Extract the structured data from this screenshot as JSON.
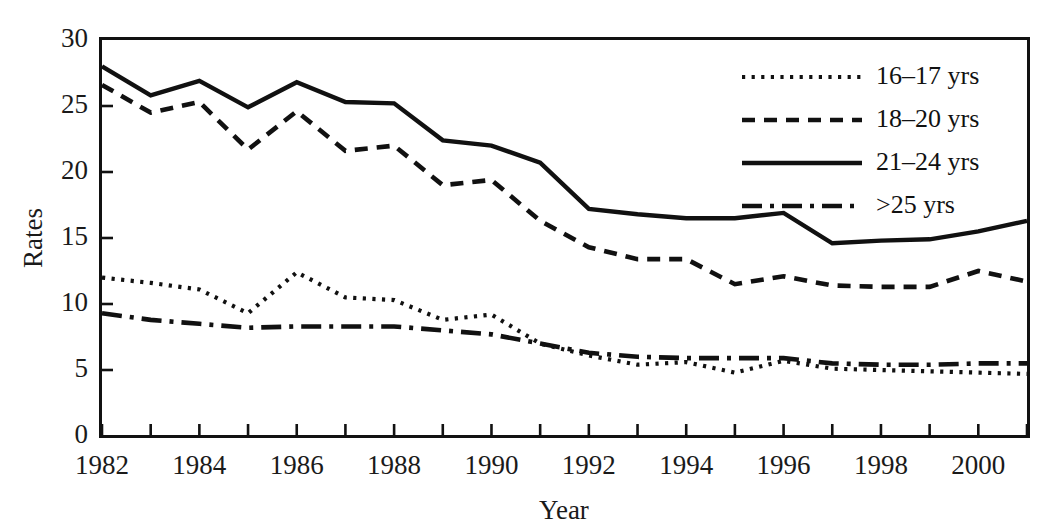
{
  "chart_data": {
    "type": "line",
    "title": "",
    "xlabel": "Year",
    "ylabel": "Rates",
    "x": [
      1982,
      1983,
      1984,
      1985,
      1986,
      1987,
      1988,
      1989,
      1990,
      1991,
      1992,
      1993,
      1994,
      1995,
      1996,
      1997,
      1998,
      1999,
      2000,
      2001
    ],
    "xlim": [
      1982,
      2001
    ],
    "ylim": [
      0,
      30
    ],
    "y_ticks": [
      0,
      5,
      10,
      15,
      20,
      25,
      30
    ],
    "y_tick_labels": [
      "0",
      "5",
      "10",
      "15",
      "20",
      "25",
      "30"
    ],
    "x_tick_labels": [
      "1982",
      "",
      "1984",
      "",
      "1986",
      "",
      "1988",
      "",
      "1990",
      "",
      "1992",
      "",
      "1994",
      "",
      "1996",
      "",
      "1998",
      "",
      "2000",
      ""
    ],
    "x_labeled_years": [
      "1982",
      "1984",
      "1986",
      "1988",
      "1990",
      "1992",
      "1994",
      "1996",
      "1998",
      "2000"
    ],
    "grid": false,
    "legend_position": "top-right",
    "series": [
      {
        "name": "16–17 yrs",
        "style": "dotted",
        "values": [
          12.0,
          11.6,
          11.1,
          9.3,
          12.4,
          10.5,
          10.3,
          8.8,
          9.2,
          7.0,
          6.1,
          5.4,
          5.6,
          4.8,
          5.7,
          5.1,
          5.0,
          4.9,
          4.8,
          4.7
        ]
      },
      {
        "name": "18–20 yrs",
        "style": "dashed",
        "values": [
          26.6,
          24.5,
          25.3,
          21.7,
          24.6,
          21.6,
          22.0,
          19.0,
          19.4,
          16.3,
          14.3,
          13.4,
          13.4,
          11.5,
          12.1,
          11.4,
          11.3,
          11.3,
          12.5,
          11.7
        ]
      },
      {
        "name": "21–24 yrs",
        "style": "solid",
        "values": [
          28.0,
          25.8,
          26.9,
          24.9,
          26.8,
          25.3,
          25.2,
          22.4,
          22.0,
          20.7,
          17.2,
          16.8,
          16.5,
          16.5,
          16.9,
          14.6,
          14.8,
          14.9,
          15.5,
          16.3
        ]
      },
      {
        "name": ">25 yrs",
        "style": "dashdot",
        "values": [
          9.3,
          8.8,
          8.5,
          8.2,
          8.3,
          8.3,
          8.3,
          8.0,
          7.7,
          7.0,
          6.3,
          6.0,
          5.9,
          5.9,
          5.9,
          5.5,
          5.4,
          5.4,
          5.5,
          5.5
        ]
      }
    ],
    "legend": [
      {
        "label": "16–17 yrs",
        "style": "dotted"
      },
      {
        "label": "18–20 yrs",
        "style": "dashed"
      },
      {
        "label": "21–24 yrs",
        "style": "solid"
      },
      {
        "label": ">25 yrs",
        "style": "dashdot"
      }
    ]
  }
}
